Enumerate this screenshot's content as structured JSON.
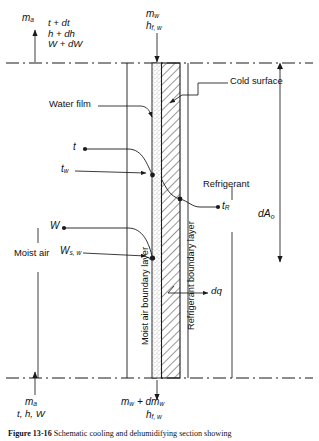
{
  "figure": {
    "caption_label": "Figure 13-16",
    "caption_text": "Schematic cooling and dehumidifying section showing"
  },
  "labels": {
    "inlet_air_mass": "m",
    "inlet_air_mass_sub": "a",
    "outlet_props": [
      "t + dt",
      "h + dh",
      "W + dW"
    ],
    "inlet_props": "t, h, W",
    "water_mass_top": "m",
    "water_mass_top_sub": "w",
    "water_enth_top": "h",
    "water_enth_top_sub": "f, w",
    "water_mass_bottom": "m",
    "water_mass_bottom_sub": "w",
    "water_mass_bottom_2": " + dm",
    "water_mass_bottom_2_sub": "w",
    "water_enth_bottom": "h",
    "water_enth_bottom_sub": "f, w",
    "cold_surface": "Cold surface",
    "water_film": "Water film",
    "moist_air": "Moist air",
    "refrigerant": "Refrigerant",
    "moist_air_boundary_layer": "Moist air boundary layer",
    "refrigerant_boundary_layer": "Refrigerant boundary layer",
    "t_air": "t",
    "t_wall": "t",
    "t_wall_sub": "w",
    "t_refrig": "t",
    "t_refrig_sub": "R",
    "humidity_air": "W",
    "humidity_sat": "W",
    "humidity_sat_sub": "s, w",
    "heat_flux": "dq",
    "area": "dA",
    "area_sub": "o"
  },
  "colors": {
    "line": "#1a1a1a",
    "hatch": "#1a1a1a",
    "stipple": "#b9b9b9",
    "text": "#111111",
    "background": "#ffffff"
  }
}
